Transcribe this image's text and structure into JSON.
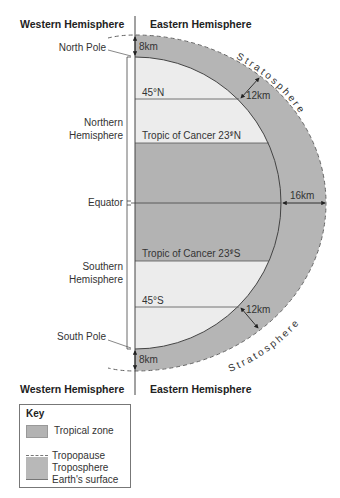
{
  "headers": {
    "top_left": "Western Hemisphere",
    "top_right": "Eastern Hemisphere",
    "bottom_left": "Western Hemisphere",
    "bottom_right": "Eastern Hemisphere"
  },
  "left_labels": {
    "north_pole": "North Pole",
    "northern_hemisphere_1": "Northern",
    "northern_hemisphere_2": "Hemisphere",
    "equator": "Equator",
    "southern_hemisphere_1": "Southern",
    "southern_hemisphere_2": "Hemisphere",
    "south_pole": "South Pole"
  },
  "latitudes": {
    "n45": "45°N",
    "tropic_n_text": "Tropic of Cancer 23",
    "tropic_n_suffix": "°N",
    "tropic_s_text": "Tropic of Cancer 23",
    "tropic_s_suffix": "°S",
    "half_num": "1",
    "half_den": "2",
    "s45": "45°S"
  },
  "measurements": {
    "pole_north": "8km",
    "mid_north": "12km",
    "equator": "16km",
    "mid_south": "12km",
    "pole_south": "8km"
  },
  "stratosphere_label": "Stratosphere",
  "key": {
    "title": "Key",
    "tropical_zone": "Tropical zone",
    "tropopause": "Tropopause",
    "troposphere": "Troposphere",
    "earth_surface": "Earth's surface"
  },
  "colors": {
    "troposphere": "#b5b5b5",
    "tropical_zone": "#b3b3b3",
    "temperate_zone": "#ececec",
    "lines": "#444444"
  }
}
